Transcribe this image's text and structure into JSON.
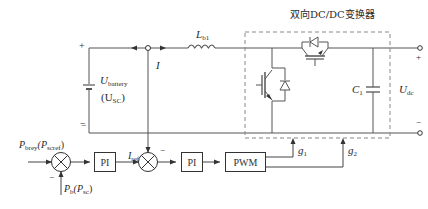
{
  "diagram": {
    "converter_title": "双向DC/DC变换器",
    "source": {
      "plus": "+",
      "minus": "−",
      "voltage_label": "U",
      "voltage_sub": "battery",
      "alt_label_open": "(U",
      "alt_sub": "SC",
      "alt_label_close": ")"
    },
    "current_label": "I",
    "inductor": {
      "label": "L",
      "sub": "b1"
    },
    "capacitor": {
      "label": "C",
      "sub": "1"
    },
    "output": {
      "plus": "+",
      "minus": "−",
      "label": "U",
      "sub": "dc"
    },
    "control": {
      "ref_power": {
        "p": "P",
        "sub1": "brey",
        "open": "(P",
        "sub2": "scref",
        "close": ")"
      },
      "feedback_power": {
        "p": "P",
        "sub1": "b",
        "open": "(P",
        "sub2": "sc",
        "close": ")"
      },
      "sum1_minus": "−",
      "sum2_minus_top": "−",
      "sum2_minus_left": "−",
      "pi1": "PI",
      "iref": {
        "label": "I",
        "sub": "ref"
      },
      "pi2": "PI",
      "pwm": "PWM",
      "g1": {
        "label": "g",
        "sub": "1"
      },
      "g2": {
        "label": "g",
        "sub": "2"
      }
    },
    "colors": {
      "line": "#444444",
      "dash": "#888888",
      "text": "#2a2a2a"
    }
  }
}
